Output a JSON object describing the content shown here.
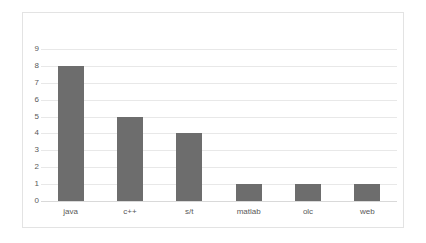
{
  "chart_data": {
    "type": "bar",
    "title": "",
    "title_visible_faint": true,
    "xlabel": "",
    "ylabel": "",
    "categories": [
      "java",
      "c++",
      "s/t",
      "matlab",
      "olc",
      "web"
    ],
    "values": [
      8,
      5,
      4,
      1,
      1,
      1
    ],
    "series": [
      {
        "name": "Series 1",
        "values": [
          8,
          5,
          4,
          1,
          1,
          1
        ]
      }
    ],
    "ylim": [
      0,
      9
    ],
    "ytick_labels": [
      "0",
      "1",
      "2",
      "3",
      "4",
      "5",
      "6",
      "7",
      "8",
      "9"
    ],
    "ytick_values": [
      0,
      1,
      2,
      3,
      4,
      5,
      6,
      7,
      8,
      9
    ],
    "grid": true,
    "grid_axis": "y",
    "legend": false,
    "legend_position": "none",
    "bar_color": "#6d6d6d",
    "gridline_color": "#e8e8e8",
    "axis_text_color": "#595959",
    "plot_background": "#ffffff",
    "frame_border_color": "#e3e3e3"
  },
  "chart": {
    "title_text": "",
    "frame_label": "chart-frame"
  }
}
